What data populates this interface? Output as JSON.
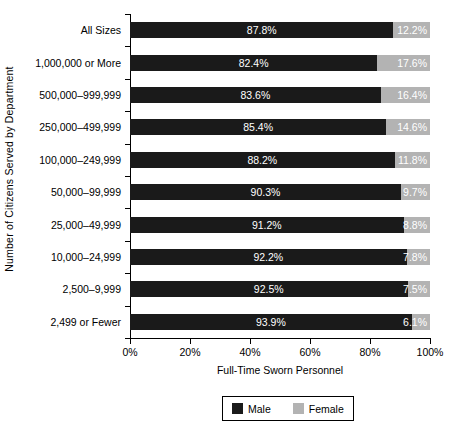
{
  "chart_data": {
    "type": "bar",
    "orientation": "horizontal",
    "stacked": true,
    "stack_mode": "percent",
    "title": "",
    "xlabel": "Full-Time Sworn Personnel",
    "ylabel": "Number of Citizens Served by Department",
    "xlim": [
      0,
      100
    ],
    "xticks": [
      0,
      20,
      40,
      60,
      80,
      100
    ],
    "xtick_labels": [
      "0%",
      "20%",
      "40%",
      "60%",
      "80%",
      "100%"
    ],
    "grid": false,
    "legend_position": "bottom",
    "categories": [
      "All Sizes",
      "1,000,000 or More",
      "500,000–999,999",
      "250,000–499,999",
      "100,000–249,999",
      "50,000–99,999",
      "25,000–49,999",
      "10,000–24,999",
      "2,500–9,999",
      "2,499 or Fewer"
    ],
    "series": [
      {
        "name": "Male",
        "color": "#1a1a1a",
        "values": [
          87.8,
          82.4,
          83.6,
          85.4,
          88.2,
          90.3,
          91.2,
          92.2,
          92.5,
          93.9
        ],
        "labels": [
          "87.8%",
          "82.4%",
          "83.6%",
          "85.4%",
          "88.2%",
          "90.3%",
          "91.2%",
          "92.2%",
          "92.5%",
          "93.9%"
        ]
      },
      {
        "name": "Female",
        "color": "#b3b3b3",
        "values": [
          12.2,
          17.6,
          16.4,
          14.6,
          11.8,
          9.7,
          8.8,
          7.8,
          7.5,
          6.1
        ],
        "labels": [
          "12.2%",
          "17.6%",
          "16.4%",
          "14.6%",
          "11.8%",
          "9.7%",
          "8.8%",
          "7.8%",
          "7.5%",
          "6.1%"
        ]
      }
    ],
    "legend": [
      {
        "label": "Male",
        "color": "#1a1a1a"
      },
      {
        "label": "Female",
        "color": "#b3b3b3"
      }
    ]
  }
}
